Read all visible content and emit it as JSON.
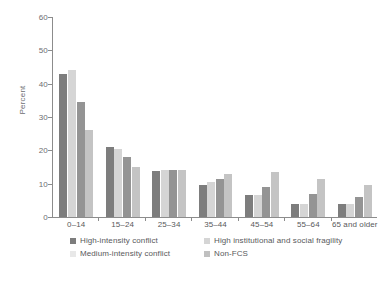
{
  "figure": {
    "title": "",
    "ylabel": "Percent"
  },
  "axis": {
    "y_ticks": [
      "0",
      "10",
      "20",
      "30",
      "40",
      "50",
      "60"
    ]
  },
  "legend": {
    "items": [
      {
        "label": "High-intensity conflict",
        "color": "#7d7d7d"
      },
      {
        "label": "High institutional and social fragility",
        "color": "#d5d5d5"
      },
      {
        "label": "Medium-intensity conflict",
        "color": "#e8e8e8"
      },
      {
        "label": "Non-FCS",
        "color": "#c0c0c0"
      }
    ]
  },
  "chart_data": {
    "type": "bar",
    "title": "",
    "xlabel": "",
    "ylabel": "Percent",
    "ylim": [
      0,
      60
    ],
    "ytick_step": 10,
    "grid": false,
    "legend_position": "bottom",
    "categories": [
      "0–14",
      "15–24",
      "25–34",
      "35–44",
      "45–54",
      "55–64",
      "65 and older"
    ],
    "series": [
      {
        "name": "High-intensity conflict",
        "color": "#7d7d7d",
        "values": [
          43.0,
          21.0,
          13.8,
          9.5,
          6.5,
          4.0,
          4.0
        ]
      },
      {
        "name": "High institutional and social fragility",
        "color": "#d5d5d5",
        "values": [
          44.0,
          20.5,
          14.2,
          10.5,
          6.5,
          4.0,
          4.0
        ]
      },
      {
        "name": "Medium-intensity conflict",
        "color": "#949494",
        "values": [
          34.5,
          18.0,
          14.0,
          11.5,
          9.0,
          7.0,
          6.0
        ]
      },
      {
        "name": "Non-FCS",
        "color": "#c4c4c4",
        "values": [
          26.0,
          15.0,
          14.2,
          13.0,
          13.5,
          11.5,
          9.5
        ]
      }
    ]
  }
}
